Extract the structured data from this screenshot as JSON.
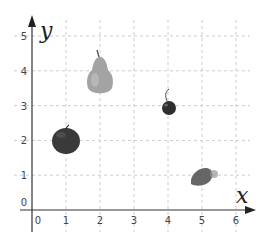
{
  "chart_data": {
    "type": "scatter",
    "title": "",
    "xlabel": "x",
    "ylabel": "y",
    "xlim": [
      0,
      6
    ],
    "ylim": [
      0,
      5
    ],
    "grid": true,
    "x_ticks": [
      "0",
      "1",
      "2",
      "3",
      "4",
      "5",
      "6"
    ],
    "y_ticks": [
      "0",
      "1",
      "2",
      "3",
      "4",
      "5"
    ],
    "points": [
      {
        "name": "apple",
        "x": 1,
        "y": 2
      },
      {
        "name": "pear",
        "x": 2,
        "y": 4
      },
      {
        "name": "cherry",
        "x": 4,
        "y": 3
      },
      {
        "name": "strawberry",
        "x": 5,
        "y": 1
      }
    ]
  },
  "colors": {
    "grid": "#cccccc",
    "axis": "#333333",
    "apple": "#3a3a3a",
    "pear": "#9a9a9a",
    "cherry": "#2e2e2e",
    "strawberry": "#6a6a6a"
  }
}
